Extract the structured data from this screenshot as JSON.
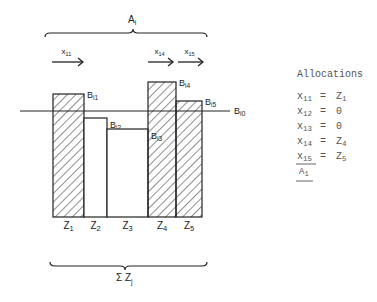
{
  "diagram": {
    "top_brace_label": "A",
    "top_brace_sub": "i",
    "bottom_brace_label": "Σ Z",
    "bottom_brace_sub": "j",
    "baseline_label": "B",
    "baseline_sub": "i0",
    "arrows": [
      {
        "label": "x",
        "sub": "11",
        "x1": 52,
        "x2": 83
      },
      {
        "label": "x",
        "sub": "14",
        "x1": 148,
        "x2": 173
      },
      {
        "label": "x",
        "sub": "15",
        "x1": 178,
        "x2": 203
      }
    ],
    "bars": [
      {
        "id": "1",
        "x": 53,
        "w": 31,
        "top": 94,
        "hatched": true,
        "b_label": "B",
        "b_sub": "i1",
        "z_label": "Z",
        "z_sub": "1"
      },
      {
        "id": "2",
        "x": 84,
        "w": 23,
        "top": 118,
        "hatched": false,
        "b_label": "B",
        "b_sub": "i2",
        "z_label": "Z",
        "z_sub": "2"
      },
      {
        "id": "3",
        "x": 107,
        "w": 41,
        "top": 129,
        "hatched": false,
        "b_label": "B",
        "b_sub": "i3",
        "z_label": "Z",
        "z_sub": "3"
      },
      {
        "id": "4",
        "x": 148,
        "w": 28,
        "top": 82,
        "hatched": true,
        "b_label": "B",
        "b_sub": "i4",
        "z_label": "Z",
        "z_sub": "4"
      },
      {
        "id": "5",
        "x": 176,
        "w": 26,
        "top": 101,
        "hatched": true,
        "b_label": "B",
        "b_sub": "i5",
        "z_label": "Z",
        "z_sub": "5"
      }
    ]
  },
  "allocations": {
    "title": "Allocations",
    "rows": [
      {
        "var": "x",
        "sub": "11",
        "eq": "=",
        "val": "Z",
        "val_sub": "1"
      },
      {
        "var": "x",
        "sub": "12",
        "eq": "=",
        "val": "0",
        "val_sub": ""
      },
      {
        "var": "x",
        "sub": "13",
        "eq": "=",
        "val": "0",
        "val_sub": ""
      },
      {
        "var": "x",
        "sub": "14",
        "eq": "=",
        "val": "Z",
        "val_sub": "4"
      },
      {
        "var": "x",
        "sub": "15",
        "eq": "=",
        "val": "Z",
        "val_sub": "5"
      }
    ],
    "total_label": "A",
    "total_sub": "1"
  }
}
